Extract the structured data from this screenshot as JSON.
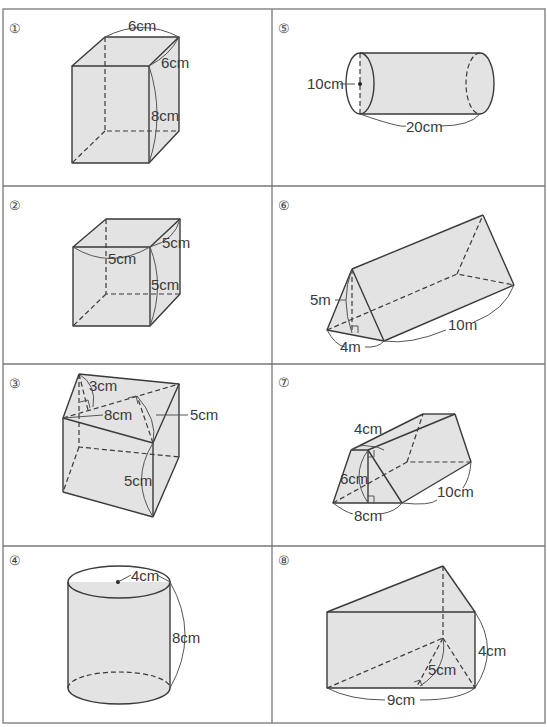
{
  "worksheet": {
    "layout": {
      "columns": 2,
      "rows": 4
    },
    "problems": [
      {
        "number": "①",
        "shape": "rectangular prism",
        "labels": {
          "top_width": "6cm",
          "depth": "6cm",
          "height": "8cm"
        }
      },
      {
        "number": "②",
        "shape": "cube",
        "labels": {
          "width": "5cm",
          "depth": "5cm",
          "height": "5cm"
        }
      },
      {
        "number": "③",
        "shape": "triangular prism",
        "labels": {
          "triangle_height": "3cm",
          "triangle_base": "8cm",
          "side": "5cm",
          "prism_height": "5cm"
        }
      },
      {
        "number": "④",
        "shape": "cylinder",
        "labels": {
          "radius": "4cm",
          "height": "8cm"
        }
      },
      {
        "number": "⑤",
        "shape": "cylinder (horizontal)",
        "labels": {
          "diameter": "10cm",
          "length": "20cm"
        }
      },
      {
        "number": "⑥",
        "shape": "triangular prism",
        "labels": {
          "triangle_height": "5m",
          "triangle_base": "4m",
          "length": "10m"
        }
      },
      {
        "number": "⑦",
        "shape": "trapezoidal prism",
        "labels": {
          "top": "4cm",
          "height": "6cm",
          "bottom": "8cm",
          "length": "10cm"
        }
      },
      {
        "number": "⑧",
        "shape": "triangular prism",
        "labels": {
          "triangle_height": "5cm",
          "base": "9cm",
          "prism_height": "4cm"
        }
      }
    ]
  }
}
